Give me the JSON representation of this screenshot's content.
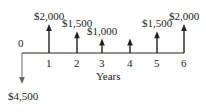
{
  "diagram": {
    "type": "cash-flow",
    "axis_label": "Years",
    "periods": [
      "0",
      "1",
      "2",
      "3",
      "4",
      "5",
      "6"
    ],
    "cash_flows": [
      {
        "period": 0,
        "amount": -4500,
        "label": "$4,500",
        "direction": "down"
      },
      {
        "period": 1,
        "amount": 2000,
        "label": "$2,000",
        "direction": "up"
      },
      {
        "period": 2,
        "amount": 1500,
        "label": "$1,500",
        "direction": "up"
      },
      {
        "period": 3,
        "amount": 1000,
        "label": "$1,000",
        "direction": "up"
      },
      {
        "period": 4,
        "amount": 1000,
        "label": "",
        "direction": "up"
      },
      {
        "period": 5,
        "amount": 1500,
        "label": "$1,500",
        "direction": "up"
      },
      {
        "period": 6,
        "amount": 2000,
        "label": "$2,000",
        "direction": "up"
      }
    ],
    "colors": {
      "ink": "#222222",
      "outflow": "#666666"
    }
  }
}
